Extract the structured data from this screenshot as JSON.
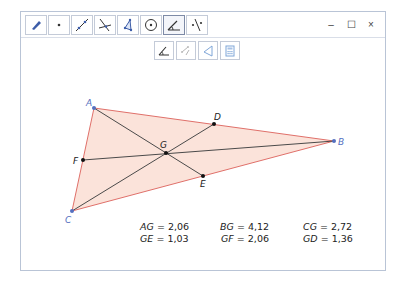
{
  "window": {
    "controls": {
      "minimize": "–",
      "maximize": "☐",
      "close": "×"
    }
  },
  "toolbar": {
    "tools": [
      {
        "name": "move-tool",
        "icon": "move-arrow-icon"
      },
      {
        "name": "point-tool",
        "icon": "point-icon"
      },
      {
        "name": "line-tool",
        "icon": "line-through-points-icon"
      },
      {
        "name": "perpendicular-tool",
        "icon": "perpendicular-line-icon"
      },
      {
        "name": "polygon-tool",
        "icon": "polygon-icon"
      },
      {
        "name": "circle-tool",
        "icon": "circle-center-point-icon"
      },
      {
        "name": "angle-tool",
        "icon": "angle-icon",
        "active": true
      },
      {
        "name": "reflect-tool",
        "icon": "reflect-about-line-icon"
      }
    ],
    "subtools": [
      {
        "name": "angle",
        "icon": "angle-icon"
      },
      {
        "name": "distance-length",
        "icon": "distance-icon"
      },
      {
        "name": "area",
        "icon": "area-triangle-icon"
      },
      {
        "name": "calculator",
        "icon": "calculator-icon"
      }
    ]
  },
  "construction": {
    "points": {
      "A": {
        "label": "A",
        "x": 94,
        "y": 108,
        "type": "vertex"
      },
      "B": {
        "label": "B",
        "x": 334,
        "y": 141,
        "type": "vertex"
      },
      "C": {
        "label": "C",
        "x": 72,
        "y": 211,
        "type": "vertex"
      },
      "D": {
        "label": "D",
        "x": 214,
        "y": 124,
        "type": "midpoint"
      },
      "E": {
        "label": "E",
        "x": 203,
        "y": 176,
        "type": "midpoint"
      },
      "F": {
        "label": "F",
        "x": 83,
        "y": 160,
        "type": "midpoint"
      },
      "G": {
        "label": "G",
        "x": 166,
        "y": 153,
        "type": "centroid"
      }
    },
    "colors": {
      "triangle_fill": "#fbe3da",
      "triangle_stroke": "#e0706a",
      "median_stroke": "#4a4a4a",
      "vertex_point": "#5470c0",
      "vertex_label": "#5470c0",
      "midpoint": "#111111"
    }
  },
  "measurements": [
    {
      "id": "AG",
      "label": "AG",
      "eq": " = ",
      "value": "2,06"
    },
    {
      "id": "BG",
      "label": "BG",
      "eq": " = ",
      "value": "4,12"
    },
    {
      "id": "CG",
      "label": "CG",
      "eq": " = ",
      "value": "2,72"
    },
    {
      "id": "GE",
      "label": "GE",
      "eq": " = ",
      "value": "1,03"
    },
    {
      "id": "GF",
      "label": "GF",
      "eq": " = ",
      "value": "2,06"
    },
    {
      "id": "GD",
      "label": "GD",
      "eq": " = ",
      "value": "1,36"
    }
  ]
}
